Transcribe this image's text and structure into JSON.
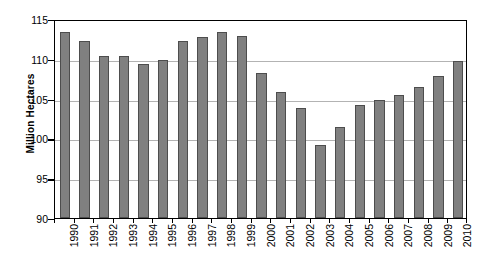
{
  "chart_data": {
    "type": "bar",
    "title": "",
    "xlabel": "",
    "ylabel": "Million Hectares",
    "ylim": [
      90,
      115
    ],
    "yticks": [
      90,
      95,
      100,
      105,
      110,
      115
    ],
    "ytick_labels": [
      "90",
      "95",
      "100",
      "105",
      "110",
      "115"
    ],
    "grid": true,
    "legend": "none",
    "bar_color": "#808080",
    "bar_edge_color": "#4d4d4d",
    "gridline_color": "#b3b3b3",
    "axis_color": "#000000",
    "categories": [
      "1990",
      "1991",
      "1992",
      "1993",
      "1994",
      "1995",
      "1996",
      "1997",
      "1998",
      "1999",
      "2000",
      "2001",
      "2002",
      "2003",
      "2004",
      "2005",
      "2006",
      "2007",
      "2008",
      "2009",
      "2010"
    ],
    "values": [
      113.4,
      112.2,
      110.3,
      110.3,
      109.4,
      109.9,
      112.2,
      112.7,
      113.4,
      112.9,
      108.2,
      105.8,
      103.8,
      99.2,
      101.5,
      104.2,
      104.8,
      105.4,
      106.5,
      107.9,
      109.7
    ]
  }
}
